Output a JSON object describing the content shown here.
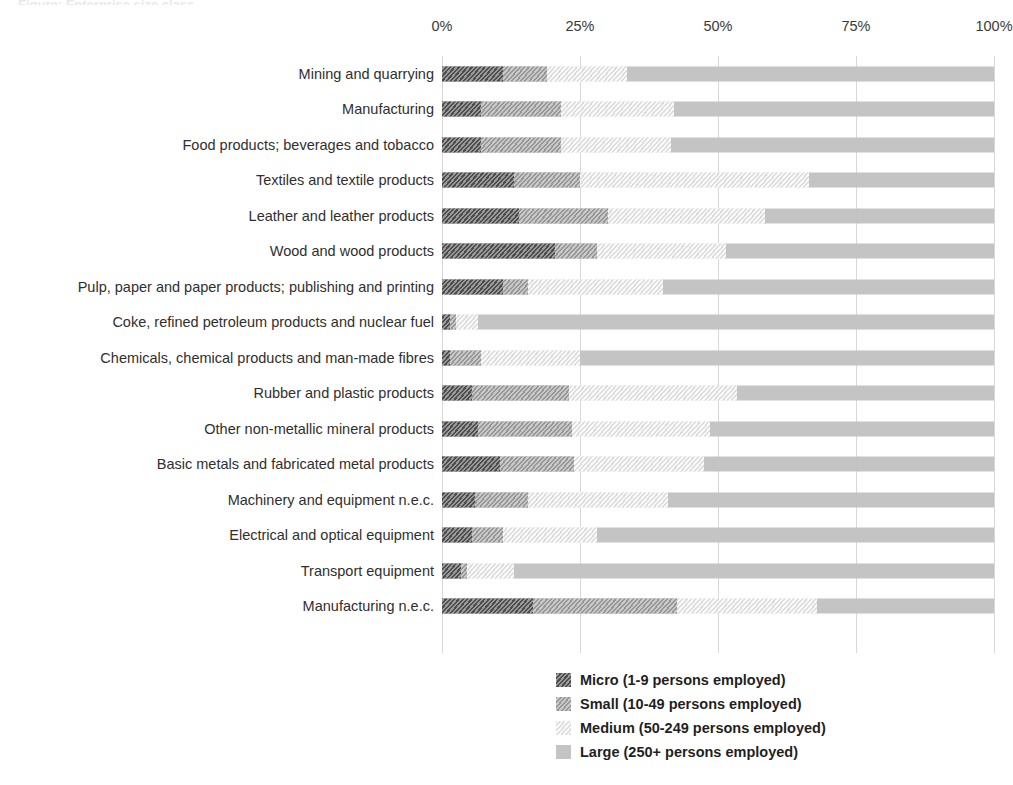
{
  "title_sliver": "Figure: Enterprise size class",
  "axis": {
    "ticks": [
      "0%",
      "25%",
      "50%",
      "75%",
      "100%"
    ],
    "tick_values": [
      0,
      25,
      50,
      75,
      100
    ]
  },
  "legend": {
    "items": [
      {
        "key": "micro",
        "label": "Micro (1-9 persons employed)"
      },
      {
        "key": "small",
        "label": "Small (10-49 persons employed)"
      },
      {
        "key": "medium",
        "label": "Medium (50-249 persons employed)"
      },
      {
        "key": "large",
        "label": "Large (250+ persons employed)"
      }
    ]
  },
  "colors": {
    "micro": "#4d4d4d",
    "small": "#969696",
    "medium": "#e4e4e4",
    "large": "#c4c4c4",
    "gridline": "#d8d8d8",
    "text": "#2f2f2f"
  },
  "chart_data": {
    "type": "bar",
    "orientation": "horizontal",
    "stacked": true,
    "normalized": true,
    "title": "",
    "xlabel": "",
    "ylabel": "",
    "xlim": [
      0,
      100
    ],
    "grid": true,
    "legend_position": "bottom-center",
    "tick_labels": [
      "0%",
      "25%",
      "50%",
      "75%",
      "100%"
    ],
    "categories": [
      "Mining and quarrying",
      "Manufacturing",
      "Food products; beverages and tobacco",
      "Textiles and textile products",
      "Leather and leather products",
      "Wood and wood products",
      "Pulp, paper and paper products; publishing and printing",
      "Coke, refined petroleum products and nuclear fuel",
      "Chemicals, chemical products and man-made fibres",
      "Rubber and plastic products",
      "Other non-metallic mineral products",
      "Basic metals and fabricated metal products",
      "Machinery and equipment n.e.c.",
      "Electrical and optical equipment",
      "Transport equipment",
      "Manufacturing n.e.c."
    ],
    "series": [
      {
        "name": "Micro (1-9 persons employed)",
        "key": "micro",
        "values": [
          11.0,
          7.0,
          7.0,
          13.0,
          14.0,
          20.5,
          11.0,
          1.5,
          1.5,
          5.5,
          6.5,
          10.5,
          6.0,
          5.5,
          3.5,
          16.5
        ]
      },
      {
        "name": "Small (10-49 persons employed)",
        "key": "small",
        "values": [
          8.0,
          14.5,
          14.5,
          12.0,
          16.0,
          7.5,
          4.5,
          1.0,
          5.5,
          17.5,
          17.0,
          13.5,
          9.5,
          5.5,
          1.0,
          26.0
        ]
      },
      {
        "name": "Medium (50-249 persons employed)",
        "key": "medium",
        "values": [
          14.5,
          20.5,
          20.0,
          41.5,
          28.5,
          23.5,
          24.5,
          4.0,
          18.0,
          30.5,
          25.0,
          23.5,
          25.5,
          17.0,
          8.5,
          25.5
        ]
      },
      {
        "name": "Large (250+ persons employed)",
        "key": "large",
        "values": [
          66.5,
          58.0,
          58.5,
          33.5,
          41.5,
          48.5,
          60.0,
          93.5,
          75.0,
          46.5,
          51.5,
          52.5,
          59.0,
          72.0,
          87.0,
          32.0
        ]
      }
    ]
  }
}
